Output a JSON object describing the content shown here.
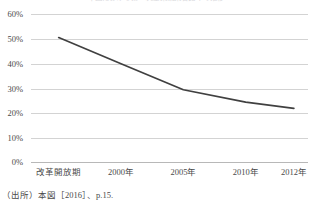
{
  "figure": {
    "title": "中国における第一次産業就業者比率の推移",
    "source_note": "（出所）本図［2016］、p.15."
  },
  "chart_data": {
    "type": "line",
    "title": "中国における第一次産業就業者比率の推移",
    "xlabel": "",
    "ylabel": "",
    "categories": [
      "改革開放期",
      "2000年",
      "2005年",
      "2010年",
      "2012年"
    ],
    "values": [
      50.5,
      40.0,
      29.5,
      24.5,
      22.0
    ],
    "series": [
      {
        "name": "比率",
        "values": [
          50.5,
          40.0,
          29.5,
          24.5,
          22.0
        ]
      }
    ],
    "ylim": [
      0,
      60
    ],
    "ytick_values": [
      60,
      50,
      40,
      30,
      20,
      10,
      0
    ],
    "ytick_labels": [
      "60%",
      "50%",
      "40%",
      "30%",
      "20%",
      "10%",
      "0%"
    ],
    "grid": true,
    "grid_axis": "y",
    "legend": false,
    "legend_position": "none",
    "markers": false,
    "line_color": "#404040",
    "grid_color": "#d3d3d3",
    "axis_color": "#b8b8b8",
    "background_color": "#ffffff"
  }
}
